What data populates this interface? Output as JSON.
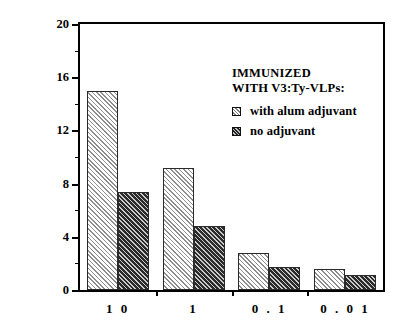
{
  "chart_data": {
    "type": "bar",
    "title": "",
    "xlabel": "",
    "ylabel": "STIMULATION INDEX",
    "categories": [
      "1 0",
      "1",
      "0 . 1",
      "0 . 0 1"
    ],
    "series": [
      {
        "name": "with alum adjuvant",
        "values": [
          15.0,
          9.2,
          2.8,
          1.6
        ]
      },
      {
        "name": "no adjuvant",
        "values": [
          7.4,
          4.8,
          1.7,
          1.1
        ]
      }
    ],
    "ylim": [
      0,
      20
    ],
    "yticks": [
      0,
      4,
      8,
      12,
      16,
      20
    ],
    "ytick_labels": [
      "0",
      "4",
      "8",
      "12",
      "16",
      "20"
    ],
    "yminor_ticks": [
      2,
      6,
      10,
      14,
      18
    ],
    "grid": false,
    "legend_position": "upper right"
  },
  "legend": {
    "title_lines": [
      "IMMUNIZED",
      "WITH V3:Ty-VLPs:"
    ],
    "entries": [
      {
        "label": "with alum adjuvant",
        "pattern": "light-hatch",
        "color": "#d8d8d8"
      },
      {
        "label": "no adjuvant",
        "pattern": "dark-hatch",
        "color": "#3a3a3a"
      }
    ]
  },
  "axes": {
    "y_title": "STIMULATION INDEX",
    "y_tick_labels": [
      "0",
      "4",
      "8",
      "12",
      "16",
      "20"
    ],
    "x_tick_labels": [
      "1 0",
      "1",
      "0 . 1",
      "0 . 0 1"
    ]
  },
  "colors": {
    "axis": "#000000",
    "background": "#ffffff",
    "series_light": "#d8d8d8",
    "series_dark": "#3a3a3a"
  }
}
